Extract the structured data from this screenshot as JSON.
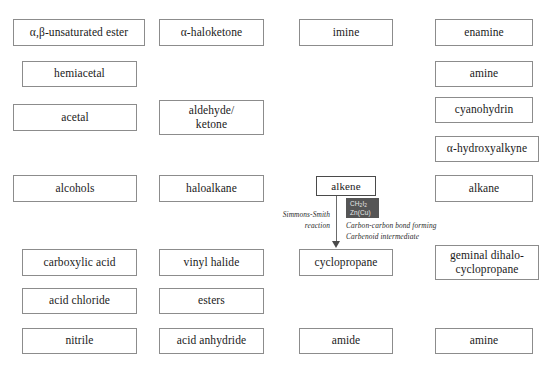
{
  "diagram": {
    "background_color": "#ffffff",
    "box_border_color": "#8c8c8c",
    "emphasis_border_color": "#4a4a4a",
    "reagent_chip_color": "#555555",
    "arrow_color": "#4a4a4a"
  },
  "boxes": [
    {
      "id": "alpha-beta-unsaturated-ester",
      "label": "α,β-unsaturated ester",
      "x": 13,
      "y": 19,
      "w": 132,
      "h": 27,
      "emphasis": false
    },
    {
      "id": "alpha-haloketone",
      "label": "α-haloketone",
      "x": 159,
      "y": 19,
      "w": 105,
      "h": 27,
      "emphasis": false
    },
    {
      "id": "imine",
      "label": "imine",
      "x": 299,
      "y": 19,
      "w": 94,
      "h": 27,
      "emphasis": false
    },
    {
      "id": "enamine",
      "label": "enamine",
      "x": 435,
      "y": 19,
      "w": 98,
      "h": 27,
      "emphasis": false
    },
    {
      "id": "hemiacetal",
      "label": "hemiacetal",
      "x": 22,
      "y": 61,
      "w": 115,
      "h": 26,
      "emphasis": false
    },
    {
      "id": "amine-top",
      "label": "amine",
      "x": 435,
      "y": 61,
      "w": 98,
      "h": 26,
      "emphasis": false
    },
    {
      "id": "acetal",
      "label": "acetal",
      "x": 13,
      "y": 104,
      "w": 124,
      "h": 27,
      "emphasis": false
    },
    {
      "id": "aldehyde-ketone",
      "label": "aldehyde/\nketone",
      "x": 159,
      "y": 100,
      "w": 105,
      "h": 35,
      "emphasis": false
    },
    {
      "id": "cyanohydrin",
      "label": "cyanohydrin",
      "x": 435,
      "y": 97,
      "w": 98,
      "h": 26,
      "emphasis": false
    },
    {
      "id": "alpha-hydroxyalkyne",
      "label": "α-hydroxyalkyne",
      "x": 435,
      "y": 136,
      "w": 104,
      "h": 26,
      "emphasis": false
    },
    {
      "id": "alcohols",
      "label": "alcohols",
      "x": 13,
      "y": 175,
      "w": 124,
      "h": 27,
      "emphasis": false
    },
    {
      "id": "haloalkane",
      "label": "haloalkane",
      "x": 159,
      "y": 175,
      "w": 105,
      "h": 27,
      "emphasis": false
    },
    {
      "id": "alkene",
      "label": "alkene",
      "x": 316,
      "y": 176,
      "w": 60,
      "h": 20,
      "emphasis": true
    },
    {
      "id": "alkane",
      "label": "alkane",
      "x": 435,
      "y": 175,
      "w": 98,
      "h": 27,
      "emphasis": false
    },
    {
      "id": "carboxylic-acid",
      "label": "carboxylic acid",
      "x": 22,
      "y": 249,
      "w": 115,
      "h": 27,
      "emphasis": false
    },
    {
      "id": "vinyl-halide",
      "label": "vinyl halide",
      "x": 159,
      "y": 249,
      "w": 105,
      "h": 27,
      "emphasis": false
    },
    {
      "id": "cyclopropane",
      "label": "cyclopropane",
      "x": 299,
      "y": 249,
      "w": 94,
      "h": 27,
      "emphasis": false
    },
    {
      "id": "geminal-dihalo-cyclopropane",
      "label": "geminal dihalo-\ncyclopropane",
      "x": 435,
      "y": 245,
      "w": 104,
      "h": 35,
      "emphasis": false
    },
    {
      "id": "acid-chloride",
      "label": "acid chloride",
      "x": 22,
      "y": 288,
      "w": 115,
      "h": 26,
      "emphasis": false
    },
    {
      "id": "esters",
      "label": "esters",
      "x": 159,
      "y": 288,
      "w": 105,
      "h": 26,
      "emphasis": false
    },
    {
      "id": "nitrile",
      "label": "nitrile",
      "x": 22,
      "y": 328,
      "w": 115,
      "h": 26,
      "emphasis": false
    },
    {
      "id": "acid-anhydride",
      "label": "acid anhydride",
      "x": 159,
      "y": 328,
      "w": 105,
      "h": 26,
      "emphasis": false
    },
    {
      "id": "amide",
      "label": "amide",
      "x": 299,
      "y": 328,
      "w": 94,
      "h": 26,
      "emphasis": false
    },
    {
      "id": "amine-bottom",
      "label": "amine",
      "x": 435,
      "y": 328,
      "w": 98,
      "h": 26,
      "emphasis": false
    }
  ],
  "reaction": {
    "from": "alkene",
    "to": "cyclopropane",
    "name_annotation": {
      "line1": "Simmons-Smith",
      "line2": "reaction"
    },
    "reagent": {
      "line1_pre": "CH",
      "line1_sub1": "2",
      "line1_mid": "I",
      "line1_sub2": "2",
      "line2": "Zn(Cu)"
    },
    "mechanism_annotation": {
      "line1": "Carbon-carbon bond forming",
      "line2": "Carbenoid intermediate"
    }
  }
}
